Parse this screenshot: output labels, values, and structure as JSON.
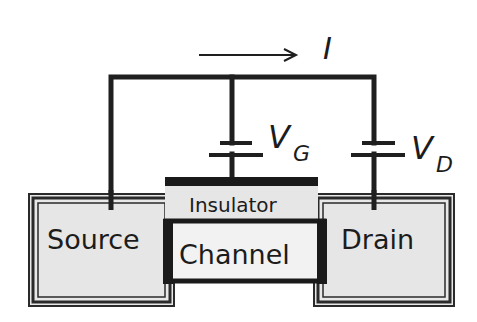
{
  "diagram": {
    "title": "",
    "current": {
      "label": "I",
      "direction": "right"
    },
    "gate_voltage": {
      "symbol": "V",
      "subscript": "G"
    },
    "drain_voltage": {
      "symbol": "V",
      "subscript": "D"
    },
    "regions": {
      "source": "Source",
      "insulator": "Insulator",
      "channel": "Channel",
      "drain": "Drain"
    },
    "colors": {
      "wire": "#1f1f1f",
      "region_fill": "#e6e6e6",
      "channel_fill": "#f2f2f2",
      "background": "#ffffff"
    }
  }
}
